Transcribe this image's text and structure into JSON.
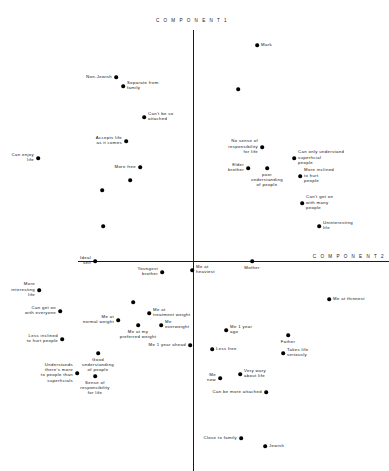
{
  "figure": {
    "axis_color": "#1a1a1a",
    "point_color": "#000000",
    "vertical_axis_label": "C O M P O N E N T   1",
    "horizontal_axis_label": "C O M P O N E N T   2",
    "origin_x": 193,
    "origin_y": 261
  },
  "chart_data": {
    "type": "scatter",
    "title": "",
    "xlabel": "COMPONENT 2",
    "ylabel": "COMPONENT 1",
    "grid": false,
    "legend": null,
    "axes": {
      "origin_px": [
        193,
        261
      ],
      "x_axis_span_px": [
        78,
        389
      ],
      "y_axis_span_px": [
        30,
        471
      ],
      "note": "Unlabeled principal-component axes; values given in pixel coordinates of plotted markers."
    },
    "points": [
      {
        "label": "Mark",
        "px": 257,
        "py": 45,
        "label_pos": "l"
      },
      {
        "label": "Non-Jewish",
        "px": 116,
        "py": 77,
        "label_pos": "r"
      },
      {
        "label": "Separate from\nfamily",
        "px": 123,
        "py": 86,
        "label_pos": "l"
      },
      {
        "label": "",
        "px": 238,
        "py": 89,
        "label_pos": "l"
      },
      {
        "label": "Can't be so\nattached",
        "px": 144,
        "py": 117,
        "label_pos": "l"
      },
      {
        "label": "Accepts life\nas it comes",
        "px": 126,
        "py": 141,
        "label_pos": "r"
      },
      {
        "label": "No sense of\nresponsibility\nfor life",
        "px": 262,
        "py": 147,
        "label_pos": "r"
      },
      {
        "label": "Can only understand\nsuperficial\npeople",
        "px": 294,
        "py": 158,
        "label_pos": "l"
      },
      {
        "label": "Elder\nbrother",
        "px": 248,
        "py": 168,
        "label_pos": "r"
      },
      {
        "label": "poor\nunderstanding\nof people",
        "px": 267,
        "py": 168,
        "label_pos": "c"
      },
      {
        "label": "More inclined\nto hurt\npeople",
        "px": 300,
        "py": 176,
        "label_pos": "l"
      },
      {
        "label": "Can enjoy\nlife",
        "px": 38,
        "py": 158,
        "label_pos": "r"
      },
      {
        "label": "More free",
        "px": 140,
        "py": 167,
        "label_pos": "r"
      },
      {
        "label": "",
        "px": 130,
        "py": 180,
        "label_pos": "l"
      },
      {
        "label": "",
        "px": 102,
        "py": 190,
        "label_pos": "l"
      },
      {
        "label": "Can't get on\nwith many\npeople",
        "px": 302,
        "py": 203,
        "label_pos": "l"
      },
      {
        "label": "",
        "px": 103,
        "py": 226,
        "label_pos": "l"
      },
      {
        "label": "Uninteresting\nlife",
        "px": 319,
        "py": 226,
        "label_pos": "l"
      },
      {
        "label": "Ideal\nself",
        "px": 95,
        "py": 261,
        "label_pos": "r"
      },
      {
        "label": "Mother",
        "px": 252,
        "py": 261,
        "label_pos": "c"
      },
      {
        "label": "Youngest\nbrother",
        "px": 162,
        "py": 272,
        "label_pos": "r"
      },
      {
        "label": "Me at\nheaviest",
        "px": 192,
        "py": 270,
        "label_pos": "l"
      },
      {
        "label": "More\ninteresting\nlife",
        "px": 39,
        "py": 290,
        "label_pos": "r"
      },
      {
        "label": "Me at thinnest",
        "px": 329,
        "py": 299,
        "label_pos": "l"
      },
      {
        "label": "",
        "px": 133,
        "py": 302,
        "label_pos": "l"
      },
      {
        "label": "Me at\ntreatment weight",
        "px": 149,
        "py": 313,
        "label_pos": "l"
      },
      {
        "label": "Can get on\nwith everyone",
        "px": 60,
        "py": 311,
        "label_pos": "r"
      },
      {
        "label": "Me at\nnormal weight",
        "px": 118,
        "py": 320,
        "label_pos": "r"
      },
      {
        "label": "Me\noverweight",
        "px": 161,
        "py": 325,
        "label_pos": "l"
      },
      {
        "label": "Me at my\npreferred weight",
        "px": 138,
        "py": 325,
        "label_pos": "c"
      },
      {
        "label": "Me 1 year\nago",
        "px": 226,
        "py": 330,
        "label_pos": "l"
      },
      {
        "label": "Father",
        "px": 288,
        "py": 335,
        "label_pos": "c"
      },
      {
        "label": "Less inclined\nto hurt people",
        "px": 62,
        "py": 339,
        "label_pos": "r"
      },
      {
        "label": "Me 1 year ahead",
        "px": 190,
        "py": 345,
        "label_pos": "r"
      },
      {
        "label": "Less free",
        "px": 212,
        "py": 349,
        "label_pos": "l"
      },
      {
        "label": "Takes life\nseriously",
        "px": 283,
        "py": 353,
        "label_pos": "l"
      },
      {
        "label": "Good\nunderstanding\nof people",
        "px": 98,
        "py": 353,
        "label_pos": "c"
      },
      {
        "label": "Understands\nthere's more\nto people than\nsuperficials",
        "px": 77,
        "py": 373,
        "label_pos": "r"
      },
      {
        "label": "Me\nnow",
        "px": 220,
        "py": 378,
        "label_pos": "r"
      },
      {
        "label": "Very wary\nabout life",
        "px": 240,
        "py": 374,
        "label_pos": "l"
      },
      {
        "label": "Sense of\nresponsibility\nfor life",
        "px": 95,
        "py": 376,
        "label_pos": "c"
      },
      {
        "label": "Can be more attached",
        "px": 266,
        "py": 392,
        "label_pos": "r"
      },
      {
        "label": "Close to family",
        "px": 241,
        "py": 438,
        "label_pos": "r"
      },
      {
        "label": "Jewish",
        "px": 265,
        "py": 446,
        "label_pos": "l"
      }
    ]
  }
}
